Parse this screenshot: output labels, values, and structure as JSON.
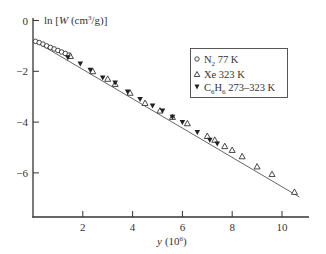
{
  "chart_data": {
    "type": "scatter",
    "title": "",
    "xlabel": "y (10^6)",
    "xlabel_main": "y",
    "xlabel_unit_base": "(10",
    "xlabel_unit_exp": "6",
    "xlabel_unit_close": ")",
    "ylabel": "ln [W (cm^3/g)]",
    "ylabel_prefix": "ln [",
    "ylabel_var": "W",
    "ylabel_unit": " (cm",
    "ylabel_unit_exp": "3",
    "ylabel_unit_close": "/g)]",
    "xlim": [
      0,
      11
    ],
    "ylim": [
      -8,
      0
    ],
    "x_ticks": [
      2,
      4,
      6,
      8,
      10
    ],
    "y_ticks": [
      0,
      -2,
      -4,
      -6
    ],
    "y_tick_labels": [
      "0",
      "−2",
      "−4",
      "−6"
    ],
    "grid": false,
    "legend_position": "upper right",
    "legend": [
      {
        "marker": "open-circle",
        "label_main": "N",
        "label_sub": "2",
        "label_rest": " 77 K",
        "label": "N2 77 K"
      },
      {
        "marker": "open-triangle",
        "label_main": "Xe 323 K",
        "label_sub": "",
        "label_rest": "",
        "label": "Xe 323 K"
      },
      {
        "marker": "filled-inverted-triangle",
        "label_main": "C",
        "label_sub": "6",
        "label_mid": "H",
        "label_sub2": "6",
        "label_rest": " 273–323 K",
        "label": "C6H6 273–323 K"
      }
    ],
    "fit_line": {
      "x": [
        0.05,
        10.7
      ],
      "y": [
        -0.8,
        -6.95
      ]
    },
    "series": [
      {
        "name": "N2 77 K",
        "marker": "open-circle",
        "points": [
          [
            0.1,
            -0.82
          ],
          [
            0.25,
            -0.87
          ],
          [
            0.4,
            -0.93
          ],
          [
            0.55,
            -1.0
          ],
          [
            0.7,
            -1.06
          ],
          [
            0.85,
            -1.12
          ],
          [
            1.0,
            -1.18
          ],
          [
            1.15,
            -1.24
          ],
          [
            1.3,
            -1.3
          ],
          [
            1.45,
            -1.36
          ]
        ]
      },
      {
        "name": "Xe 323 K",
        "marker": "open-triangle",
        "points": [
          [
            1.5,
            -1.4
          ],
          [
            2.4,
            -2.0
          ],
          [
            3.0,
            -2.3
          ],
          [
            3.3,
            -2.5
          ],
          [
            3.9,
            -2.85
          ],
          [
            4.5,
            -3.25
          ],
          [
            5.1,
            -3.55
          ],
          [
            5.6,
            -3.8
          ],
          [
            6.2,
            -4.05
          ],
          [
            7.0,
            -4.55
          ],
          [
            7.3,
            -4.7
          ],
          [
            7.7,
            -4.95
          ],
          [
            8.0,
            -5.1
          ],
          [
            8.4,
            -5.35
          ],
          [
            9.0,
            -5.75
          ],
          [
            9.6,
            -6.05
          ],
          [
            10.5,
            -6.75
          ]
        ]
      },
      {
        "name": "C6H6 273–323 K",
        "marker": "filled-inverted-triangle",
        "points": [
          [
            1.4,
            -1.45
          ],
          [
            1.9,
            -1.7
          ],
          [
            2.3,
            -1.95
          ],
          [
            2.8,
            -2.25
          ],
          [
            3.3,
            -2.45
          ],
          [
            3.8,
            -2.8
          ],
          [
            4.3,
            -3.1
          ],
          [
            4.8,
            -3.35
          ],
          [
            5.2,
            -3.55
          ],
          [
            5.6,
            -3.8
          ],
          [
            6.0,
            -4.0
          ],
          [
            6.6,
            -4.4
          ],
          [
            7.1,
            -4.7
          ],
          [
            7.4,
            -4.85
          ]
        ]
      }
    ]
  }
}
